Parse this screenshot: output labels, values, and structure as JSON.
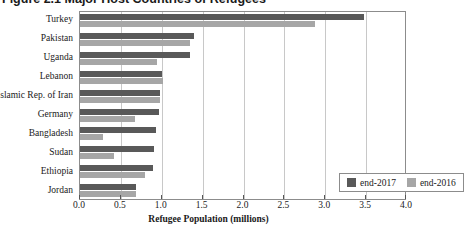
{
  "figure": {
    "title": "Figure 2.1  Major Host Countries of Refugees",
    "title_clipped": true
  },
  "legend": {
    "position": "inside-bottom-right",
    "items": [
      {
        "label": "end-2017",
        "color": "#595959"
      },
      {
        "label": "end-2016",
        "color": "#a6a6a6"
      }
    ]
  },
  "axis": {
    "x_title": "Refugee Population (millions)",
    "x_ticks": [
      "0.0",
      "0.5",
      "1.0",
      "1.5",
      "2.0",
      "2.5",
      "3.0",
      "3.5",
      "4.0"
    ]
  },
  "chart_data": {
    "type": "bar",
    "orientation": "horizontal",
    "title": "Figure 2.1  Major Host Countries of Refugees",
    "xlabel": "Refugee Population (millions)",
    "ylabel": "",
    "xlim": [
      0.0,
      4.0
    ],
    "xticks": [
      0.0,
      0.5,
      1.0,
      1.5,
      2.0,
      2.5,
      3.0,
      3.5,
      4.0
    ],
    "grid": true,
    "grid_axis": "x",
    "legend_position": "lower right",
    "categories": [
      "Turkey",
      "Pakistan",
      "Uganda",
      "Lebanon",
      "Islamic Rep. of Iran",
      "Germany",
      "Bangladesh",
      "Sudan",
      "Ethiopia",
      "Jordan"
    ],
    "series": [
      {
        "name": "end-2017",
        "color": "#595959",
        "values": [
          3.48,
          1.39,
          1.35,
          1.0,
          0.98,
          0.97,
          0.93,
          0.91,
          0.89,
          0.69
        ]
      },
      {
        "name": "end-2016",
        "color": "#a6a6a6",
        "values": [
          2.87,
          1.35,
          0.94,
          1.01,
          0.98,
          0.67,
          0.28,
          0.42,
          0.79,
          0.69
        ]
      }
    ]
  }
}
